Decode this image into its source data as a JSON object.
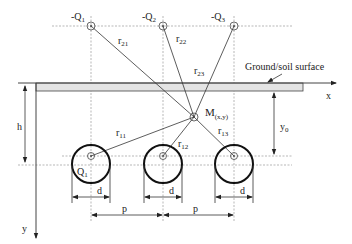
{
  "diagram": {
    "image_charges": [
      {
        "label": "-Q",
        "sub": "1"
      },
      {
        "label": "-Q",
        "sub": "2"
      },
      {
        "label": "-Q",
        "sub": "3"
      }
    ],
    "conductors": [
      {
        "label": "Q",
        "sub": "1"
      },
      {
        "label": "",
        "sub": ""
      },
      {
        "label": "",
        "sub": ""
      }
    ],
    "distances_to_images": [
      {
        "label": "r",
        "sub": "21"
      },
      {
        "label": "r",
        "sub": "22"
      },
      {
        "label": "r",
        "sub": "23"
      }
    ],
    "distances_to_conductors": [
      {
        "label": "r",
        "sub": "11"
      },
      {
        "label": "r",
        "sub": "12"
      },
      {
        "label": "r",
        "sub": "13"
      }
    ],
    "point": {
      "label": "M",
      "sub": "(x,y)"
    },
    "ground_label": "Ground/soil surface",
    "axes": {
      "x": "x",
      "y": "y"
    },
    "dimensions": {
      "depth": "h",
      "point_depth": {
        "label": "y",
        "sub": "0"
      },
      "diameter": "d",
      "spacing": "p"
    }
  }
}
